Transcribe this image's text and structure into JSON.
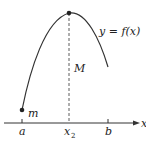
{
  "figure": {
    "curve_label": "y = f(x)",
    "max_label": "M",
    "min_label": "m",
    "axis_label": "x",
    "ticks": [
      {
        "label": "a"
      },
      {
        "label": "x",
        "sub": "2"
      },
      {
        "label": "b"
      }
    ]
  },
  "colors": {
    "stroke": "#333333",
    "background": "#ffffff"
  }
}
